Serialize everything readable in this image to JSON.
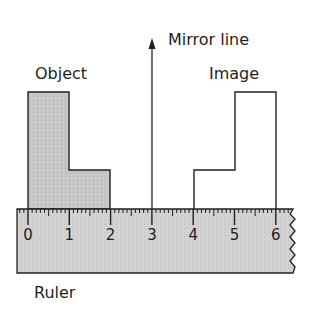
{
  "labels": {
    "object": "Object",
    "image": "Image",
    "mirror_line": "Mirror line",
    "ruler": "Ruler"
  },
  "ruler": {
    "numbers": [
      "0",
      "1",
      "2",
      "3",
      "4",
      "5",
      "6"
    ]
  },
  "colors": {
    "object_fill": "#c8c8c8",
    "ruler_fill": "#d4d4d4",
    "stroke": "#231f20"
  }
}
